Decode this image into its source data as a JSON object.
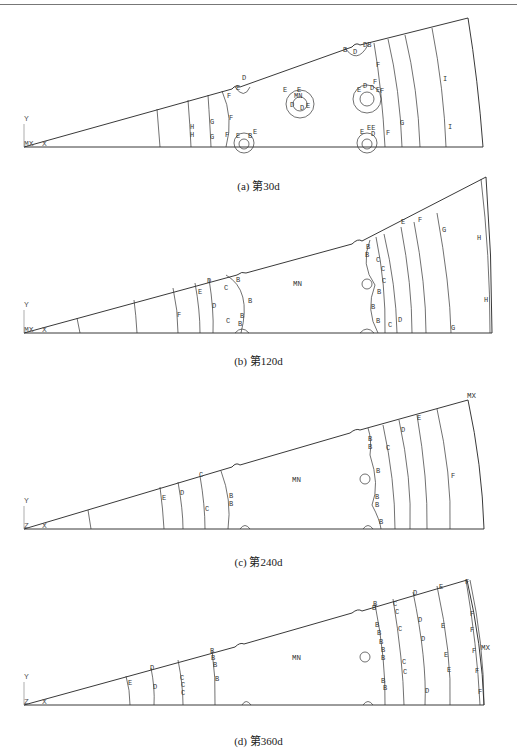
{
  "figure": {
    "panels": [
      {
        "id": "a",
        "caption": "(a) 第30d",
        "axis_labels": {
          "y": "Y",
          "origin": "MX",
          "x": "X"
        },
        "extreme_labels": [
          "MN"
        ],
        "contour_labels": [
          "H",
          "H",
          "G",
          "G",
          "F",
          "F",
          "E",
          "D",
          "D",
          "E",
          "F",
          "F",
          "G",
          "I",
          "I",
          "B",
          "D",
          "E",
          "F",
          "E",
          "D",
          "D",
          "E",
          "D",
          "E",
          "F"
        ]
      },
      {
        "id": "b",
        "caption": "(b) 第120d",
        "axis_labels": {
          "y": "Y",
          "origin": "MX",
          "x": "X"
        },
        "extreme_labels": [
          "MN"
        ],
        "contour_labels": [
          "F",
          "E",
          "D",
          "D",
          "C",
          "C",
          "B",
          "B",
          "B",
          "B",
          "C",
          "C",
          "C",
          "B",
          "B",
          "B",
          "C",
          "D",
          "E",
          "F",
          "G",
          "G",
          "H",
          "H"
        ]
      },
      {
        "id": "c",
        "caption": "(c) 第240d",
        "axis_labels": {
          "y": "Y",
          "origin": "Z",
          "x": "X"
        },
        "extreme_labels": [
          "MN",
          "MX"
        ],
        "contour_labels": [
          "E",
          "D",
          "C",
          "C",
          "B",
          "B",
          "B",
          "B",
          "C",
          "B",
          "B",
          "B",
          "B",
          "D",
          "E",
          "F"
        ]
      },
      {
        "id": "d",
        "caption": "(d) 第360d",
        "axis_labels": {
          "y": "Y",
          "origin": "Z",
          "x": "X"
        },
        "extreme_labels": [
          "MN",
          "MX"
        ],
        "contour_labels": [
          "E",
          "D",
          "D",
          "C",
          "C",
          "C",
          "B",
          "B",
          "B",
          "B",
          "B",
          "B",
          "B",
          "B",
          "B",
          "B",
          "C",
          "C",
          "C",
          "C",
          "C",
          "D",
          "D",
          "D",
          "D",
          "E",
          "E",
          "E",
          "E",
          "E",
          "F",
          "F",
          "F",
          "F",
          "F"
        ]
      }
    ]
  }
}
